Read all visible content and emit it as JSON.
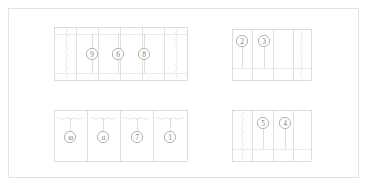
{
  "drawing": {
    "title": "Assembly Callout Layout",
    "background_color": "#ffffff",
    "line_color": "#d2d2d2",
    "balloon_stroke_color": "#9a9a9a",
    "balloon_text_color": "#7d7d7d",
    "frame": {
      "x": 8,
      "y": 8,
      "width": 351,
      "height": 170
    }
  },
  "panels": [
    {
      "id": "panel-top-left",
      "name": "top-left-panel",
      "x": 54,
      "y": 27,
      "width": 133,
      "height": 53,
      "columns": 6,
      "column_x": [
        76,
        98,
        120,
        142,
        164
      ],
      "rails_y": [
        34,
        73
      ],
      "break_lines_x": [
        66,
        176
      ],
      "balloons": [
        {
          "label": "9",
          "cx": 92,
          "cy": 54,
          "stem_top": 34,
          "stem_bottom": 73
        },
        {
          "label": "6",
          "cx": 118,
          "cy": 54,
          "stem_top": 34,
          "stem_bottom": 73
        },
        {
          "label": "8",
          "cx": 144,
          "cy": 54,
          "stem_top": 34,
          "stem_bottom": 73
        }
      ]
    },
    {
      "id": "panel-top-right",
      "name": "top-right-panel",
      "x": 232,
      "y": 29,
      "width": 79,
      "height": 51,
      "columns": 4,
      "column_x": [
        252,
        273,
        293
      ],
      "rails_y": [
        68
      ],
      "break_lines_x": [
        301
      ],
      "balloons": [
        {
          "label": "2",
          "cx": 242,
          "cy": 41,
          "stem_top": 47,
          "stem_bottom": 68
        },
        {
          "label": "3",
          "cx": 264,
          "cy": 41,
          "stem_top": 47,
          "stem_bottom": 68
        }
      ]
    },
    {
      "id": "panel-bottom-left",
      "name": "bottom-left-panel",
      "x": 54,
      "y": 110,
      "width": 133,
      "height": 51,
      "columns": 4,
      "column_x": [
        87,
        120,
        153
      ],
      "rails_y": [],
      "break_lines_x": [],
      "zigzag_rows_y": [
        118
      ],
      "balloons": [
        {
          "label": "10",
          "cx": 70,
          "cy": 137,
          "stem_top": 118,
          "stem_bottom": 131
        },
        {
          "label": "11",
          "cx": 103,
          "cy": 137,
          "stem_top": 118,
          "stem_bottom": 131
        },
        {
          "label": "7",
          "cx": 137,
          "cy": 137,
          "stem_top": 118,
          "stem_bottom": 131
        },
        {
          "label": "1",
          "cx": 170,
          "cy": 137,
          "stem_top": 118,
          "stem_bottom": 131
        }
      ]
    },
    {
      "id": "panel-bottom-right",
      "name": "bottom-right-panel",
      "x": 232,
      "y": 110,
      "width": 79,
      "height": 51,
      "columns": 4,
      "column_x": [
        252,
        273,
        293
      ],
      "rails_y": [
        149
      ],
      "break_lines_x": [
        242
      ],
      "balloons": [
        {
          "label": "5",
          "cx": 263,
          "cy": 123,
          "stem_top": 129,
          "stem_bottom": 149
        },
        {
          "label": "4",
          "cx": 285,
          "cy": 123,
          "stem_top": 129,
          "stem_bottom": 149
        }
      ]
    }
  ],
  "balloon_labels": [
    "1",
    "2",
    "3",
    "4",
    "5",
    "6",
    "7",
    "8",
    "9",
    "10",
    "11"
  ]
}
